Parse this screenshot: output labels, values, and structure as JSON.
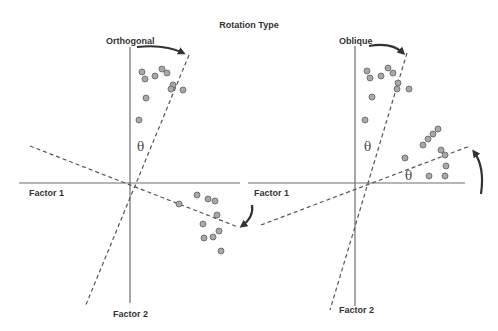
{
  "title": "Rotation Type",
  "panels": [
    {
      "name": "orthogonal",
      "label": "Orthogonal",
      "axis_x_label": "Factor 1",
      "axis_y_label": "Factor 2",
      "theta_labels": [
        "θ"
      ],
      "points_upper": [
        [
          142,
          72
        ],
        [
          145,
          79
        ],
        [
          155,
          76
        ],
        [
          162,
          69
        ],
        [
          167,
          73
        ],
        [
          173,
          85
        ],
        [
          171,
          89
        ],
        [
          183,
          90
        ],
        [
          146,
          98
        ],
        [
          139,
          120
        ]
      ],
      "points_lower": [
        [
          179,
          204
        ],
        [
          197,
          195
        ],
        [
          208,
          199
        ],
        [
          215,
          201
        ],
        [
          217,
          215
        ],
        [
          203,
          224
        ],
        [
          219,
          231
        ],
        [
          213,
          237
        ],
        [
          204,
          238
        ],
        [
          221,
          251
        ]
      ]
    },
    {
      "name": "oblique",
      "label": "Oblique",
      "axis_x_label": "Factor 1",
      "axis_y_label": "Factor 2",
      "theta_labels": [
        "θ",
        "θ"
      ],
      "points_upper": [
        [
          367,
          71
        ],
        [
          370,
          78
        ],
        [
          381,
          76
        ],
        [
          388,
          68
        ],
        [
          393,
          73
        ],
        [
          398,
          83
        ],
        [
          397,
          89
        ],
        [
          409,
          89
        ],
        [
          372,
          97
        ],
        [
          365,
          120
        ]
      ],
      "points_lower": [
        [
          423,
          145
        ],
        [
          428,
          139
        ],
        [
          433,
          134
        ],
        [
          438,
          129
        ],
        [
          405,
          158
        ],
        [
          441,
          150
        ],
        [
          445,
          155
        ],
        [
          446,
          166
        ],
        [
          445,
          176
        ],
        [
          429,
          176
        ]
      ]
    }
  ],
  "colors": {
    "axis": "#6e6e6e",
    "dashed": "#555555",
    "point_fill": "#a8a8a8",
    "point_stroke": "#6a6a6a",
    "arrow": "#333333",
    "text": "#333333"
  }
}
